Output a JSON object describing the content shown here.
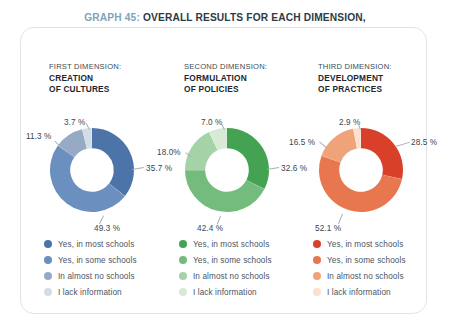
{
  "title": {
    "graph_number": "GRAPH 45:",
    "line1_rest": " OVERALL RESULTS FOR EACH DIMENSION,",
    "line2": "BY INSPECTORS OF THE SPECIAL MODALITY (COMPARISON)"
  },
  "legend_labels": [
    "Yes, in most schools",
    "Yes, in some schools",
    "In almost no schools",
    "I lack information"
  ],
  "chart_data": [
    {
      "type": "pie",
      "title": "CREATION OF CULTURES",
      "kicker": "FIRST DIMENSION:",
      "hole": 0.52,
      "start_angle": 0,
      "direction": "clockwise",
      "categories": [
        "Yes, in most schools",
        "Yes, in some schools",
        "In almost no schools",
        "I lack information"
      ],
      "values": [
        35.7,
        49.3,
        11.3,
        3.7
      ],
      "labels": [
        "35.7 %",
        "49.3 %",
        "11.3 %",
        "3.7 %"
      ],
      "colors": [
        "#4c74a8",
        "#6b8fbe",
        "#96aac5",
        "#d3dde8"
      ]
    },
    {
      "type": "pie",
      "title": "FORMULATION OF POLICIES",
      "kicker": "SECOND DIMENSION:",
      "hole": 0.52,
      "start_angle": 0,
      "direction": "clockwise",
      "categories": [
        "Yes, in most schools",
        "Yes, in some schools",
        "In almost no schools",
        "I lack information"
      ],
      "values": [
        32.6,
        42.4,
        18.0,
        7.0
      ],
      "labels": [
        "32.6 %",
        "42.4 %",
        "18.0%",
        "7.0 %"
      ],
      "colors": [
        "#43a353",
        "#74bb7e",
        "#a6d2a8",
        "#d8ead6"
      ]
    },
    {
      "type": "pie",
      "title": "DEVELOPMENT OF PRACTICES",
      "kicker": "THIRD DIMENSION:",
      "hole": 0.52,
      "start_angle": 0,
      "direction": "clockwise",
      "categories": [
        "Yes, in most schools",
        "Yes, in some schools",
        "In almost no schools",
        "I lack information"
      ],
      "values": [
        28.5,
        52.1,
        16.5,
        2.9
      ],
      "labels": [
        "28.5 %",
        "52.1 %",
        "16.5 %",
        "2.9 %"
      ],
      "colors": [
        "#d9402a",
        "#e8764f",
        "#f0a379",
        "#fae0cf"
      ]
    }
  ],
  "columns": [
    {
      "kicker": "FIRST DIMENSION:",
      "name_line1": "CREATION",
      "name_line2": "OF CULTURES"
    },
    {
      "kicker": "SECOND DIMENSION:",
      "name_line1": "FORMULATION",
      "name_line2": "OF  POLICIES"
    },
    {
      "kicker": "THIRD DIMENSION:",
      "name_line1": "DEVELOPMENT",
      "name_line2": "OF PRACTICES"
    }
  ]
}
